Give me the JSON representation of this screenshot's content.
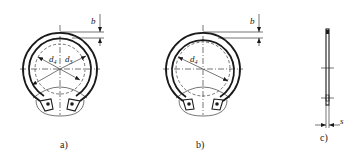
{
  "figure": {
    "views": [
      {
        "id": "a",
        "caption": "a)",
        "labels": {
          "width": "b",
          "diameter_1": "d",
          "diameter_1_sub": "4",
          "diameter_2": "d",
          "diameter_2_sub": "3"
        }
      },
      {
        "id": "b",
        "caption": "b)",
        "labels": {
          "width": "b",
          "diameter_1": "d",
          "diameter_1_sub": "4"
        }
      },
      {
        "id": "c",
        "caption": "c)",
        "labels": {
          "thickness": "s"
        }
      }
    ]
  },
  "colors": {
    "line": "#1a1a1a",
    "background": "#ffffff"
  }
}
